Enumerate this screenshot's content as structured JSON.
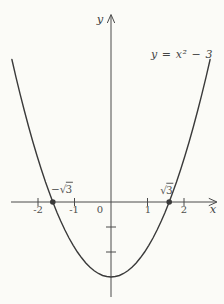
{
  "figure": {
    "equation_label": "y = x² − 3",
    "y_axis_label": "y",
    "x_axis_label": "x",
    "origin_label": "0",
    "x_tick_labels": {
      "m2": "-2",
      "m1": "-1",
      "p1": "1",
      "p2": "2"
    },
    "roots": {
      "left_sign": "−",
      "right_sign": "",
      "radical": "√",
      "radicand": "3"
    },
    "colors": {
      "paper": "#fbfbf7",
      "curve_ink": "#3a3a3a",
      "axis_ink": "#4a4a4a",
      "text_ink": "#4e4e4e"
    }
  },
  "chart_data": {
    "type": "line",
    "equation": "y = x^2 - 3",
    "xlabel": "x",
    "ylabel": "y",
    "xlim": [
      -3.05,
      3.2
    ],
    "ylim": [
      -3.9,
      7.4
    ],
    "grid": false,
    "x_ticks": [
      -2,
      -1,
      1,
      2
    ],
    "y_ticks": [
      -1,
      -2
    ],
    "vertex": [
      0,
      -3
    ],
    "x_intercepts": [
      -1.732,
      1.732
    ],
    "marked_points": [
      [
        -1.732,
        0
      ],
      [
        1.732,
        0
      ]
    ],
    "series": [
      {
        "name": "y = x^2 - 3",
        "x": [
          -2.95,
          -2.83,
          -2.7,
          -2.58,
          -2.45,
          -2.33,
          -2.2,
          -2.08,
          -1.95,
          -1.84,
          -1.732,
          -1.6,
          -1.5,
          -1.375,
          -1.25,
          -1.125,
          -1.0,
          -0.875,
          -0.75,
          -0.625,
          -0.5,
          -0.375,
          -0.25,
          -0.125,
          0,
          0.125,
          0.25,
          0.375,
          0.5,
          0.625,
          0.75,
          0.875,
          1.0,
          1.125,
          1.25,
          1.375,
          1.5,
          1.6,
          1.732,
          1.84,
          1.95,
          2.08,
          2.2,
          2.33,
          2.45,
          2.58,
          2.7,
          2.83,
          2.95
        ],
        "y": [
          5.7,
          5.01,
          4.29,
          3.66,
          3.0,
          2.43,
          1.84,
          1.33,
          0.8,
          0.39,
          0.0,
          -0.44,
          -0.75,
          -1.11,
          -1.44,
          -1.73,
          -2.0,
          -2.23,
          -2.44,
          -2.61,
          -2.75,
          -2.86,
          -2.94,
          -2.98,
          -3.0,
          -2.98,
          -2.94,
          -2.86,
          -2.75,
          -2.61,
          -2.44,
          -2.23,
          -2.0,
          -1.73,
          -1.44,
          -1.11,
          -0.75,
          -0.44,
          0.0,
          0.39,
          0.8,
          1.33,
          1.84,
          2.43,
          3.0,
          3.66,
          4.29,
          5.01,
          5.7
        ]
      }
    ]
  }
}
